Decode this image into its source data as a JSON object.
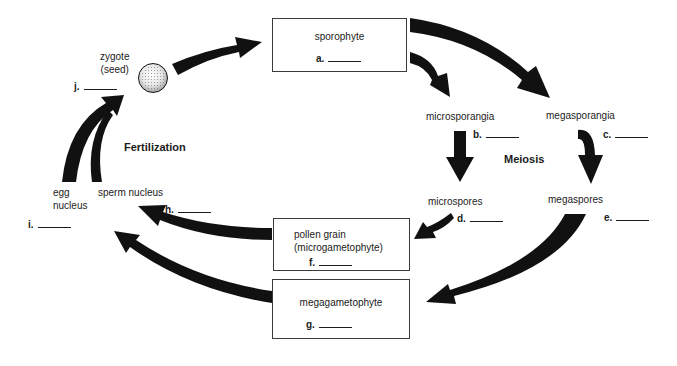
{
  "diagram": {
    "colors": {
      "arrow": "#111111",
      "text": "#1c1c1c",
      "box_border": "#3a3a3a",
      "background": "#ffffff"
    },
    "process_labels": {
      "meiosis": "Meiosis",
      "fertilization": "Fertilization"
    },
    "nodes": {
      "sporophyte": {
        "label": "sporophyte",
        "blank": "a."
      },
      "microsporangia": {
        "label": "microsporangia",
        "blank": "b."
      },
      "megasporangia": {
        "label": "megasporangia",
        "blank": "c."
      },
      "microspores": {
        "label": "microspores",
        "blank": "d."
      },
      "megaspores": {
        "label": "megaspores",
        "blank": "e."
      },
      "pollen_grain": {
        "label_line1": "pollen grain",
        "label_line2": "(microgametophyte)",
        "blank": "f."
      },
      "megagametophyte": {
        "label": "megagametophyte",
        "blank": "g."
      },
      "sperm_nucleus": {
        "label": "sperm nucleus",
        "blank": "h."
      },
      "egg_nucleus": {
        "label_line1": "egg",
        "label_line2": "nucleus",
        "blank": "i."
      },
      "zygote": {
        "label_line1": "zygote",
        "label_line2": "(seed)",
        "blank": "j."
      }
    },
    "edges": [
      {
        "from": "zygote",
        "to": "sporophyte"
      },
      {
        "from": "sporophyte",
        "to": "microsporangia"
      },
      {
        "from": "sporophyte",
        "to": "megasporangia"
      },
      {
        "from": "microsporangia",
        "to": "microspores"
      },
      {
        "from": "megasporangia",
        "to": "megaspores"
      },
      {
        "from": "microspores",
        "to": "pollen_grain"
      },
      {
        "from": "megaspores",
        "to": "megagametophyte"
      },
      {
        "from": "pollen_grain",
        "to": "sperm_nucleus"
      },
      {
        "from": "megagametophyte",
        "to": "egg_nucleus"
      },
      {
        "from": "egg_nucleus",
        "to": "zygote"
      },
      {
        "from": "sperm_nucleus",
        "to": "zygote"
      }
    ]
  }
}
